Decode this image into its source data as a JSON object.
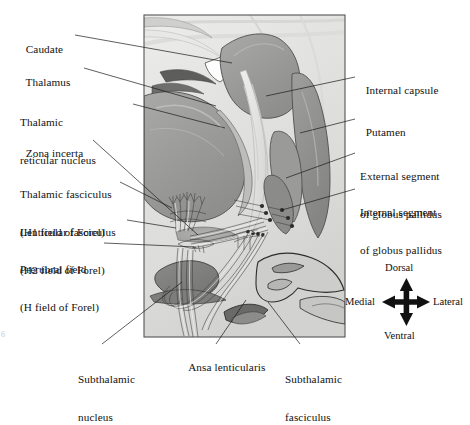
{
  "figure": {
    "type": "anatomical-diagram",
    "panel": {
      "x": 144,
      "y": 15,
      "width": 201,
      "height": 322,
      "border_color": "#555555",
      "background": "grayscale-histology"
    }
  },
  "labels_left": [
    {
      "id": "caudate",
      "text": "Caudate",
      "x": 20,
      "y": 37,
      "lines": [
        "Caudate"
      ]
    },
    {
      "id": "thalamus",
      "text": "Thalamus",
      "x": 20,
      "y": 70,
      "lines": [
        "Thalamus"
      ]
    },
    {
      "id": "thalamic-reticular-nucleus",
      "x": 20,
      "y": 98,
      "lines": [
        "Thalamic",
        "reticular nucleus"
      ]
    },
    {
      "id": "zona-incerta",
      "x": 20,
      "y": 136,
      "lines": [
        "Zona incerta"
      ]
    },
    {
      "id": "thalamic-fasciculus",
      "x": 20,
      "y": 167,
      "lines": [
        "Thalamic fasciculus",
        "(H1 field of Forel)"
      ]
    },
    {
      "id": "lenticular-fasciculus",
      "x": 20,
      "y": 206,
      "lines": [
        "Lenticular fasciculus",
        "(H2 field of Forel)"
      ]
    },
    {
      "id": "prerubral-field",
      "x": 20,
      "y": 243,
      "lines": [
        "Prerubral field",
        "(H field of Forel)"
      ]
    }
  ],
  "labels_right": [
    {
      "id": "internal-capsule",
      "x": 358,
      "y": 77,
      "lines": [
        "Internal capsule"
      ]
    },
    {
      "id": "putamen",
      "x": 358,
      "y": 119,
      "lines": [
        "Putamen"
      ]
    },
    {
      "id": "external-segment-globus-pallidus",
      "x": 358,
      "y": 149,
      "lines": [
        "External segment",
        "of globus pallidus"
      ]
    },
    {
      "id": "internal-segment-globus-pallidus",
      "x": 358,
      "y": 185,
      "lines": [
        "Internal segment",
        "of globus pallidus"
      ]
    }
  ],
  "labels_bottom": [
    {
      "id": "subthalamic-nucleus",
      "x": 78,
      "y": 352,
      "lines": [
        "Subthalamic",
        "nucleus"
      ]
    },
    {
      "id": "ansa-lenticularis",
      "x": 183,
      "y": 352,
      "lines": [
        "Ansa lenticularis"
      ]
    },
    {
      "id": "subthalamic-fasciculus",
      "x": 285,
      "y": 352,
      "lines": [
        "Subthalamic",
        "fasciculus"
      ]
    }
  ],
  "compass": {
    "id": "orientation-compass",
    "center": {
      "x": 406,
      "y": 302
    },
    "dorsal": "Dorsal",
    "ventral": "Ventral",
    "medial": "Medial",
    "lateral": "Lateral"
  },
  "page_number": "6",
  "colors": {
    "ink": "#1a1a1a",
    "panel_border": "#555555",
    "tract_line": "#f7f7f5",
    "tract_outline": "#3a3a3a",
    "gray_dark": "#8d8d8d",
    "gray_mid": "#a8a8a8",
    "gray_light": "#cfcfcf",
    "gray_pale": "#e6e6e4"
  }
}
